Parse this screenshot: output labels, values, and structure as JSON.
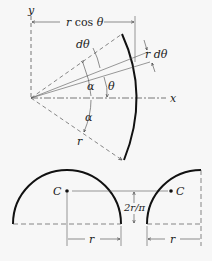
{
  "upper_figure": {
    "axis_y_label": "y",
    "axis_x_label": "x",
    "dim_rcos_r": "r",
    "dim_rcos_text": " cos ",
    "dim_rcos_theta": "θ",
    "label_dtheta": "dθ",
    "label_r_dtheta": "r dθ",
    "label_theta": "θ",
    "label_alpha_upper": "α",
    "label_alpha_lower": "α",
    "label_r": "r"
  },
  "lower_figure": {
    "left_centroid_label": "C",
    "right_centroid_label": "C",
    "centroid_height_label": "2r/π",
    "left_radius_label": "r",
    "right_radius_label": "r"
  },
  "colors": {
    "background": "#f7f7f7",
    "ink": "#111111",
    "thin_line": "#555555"
  }
}
